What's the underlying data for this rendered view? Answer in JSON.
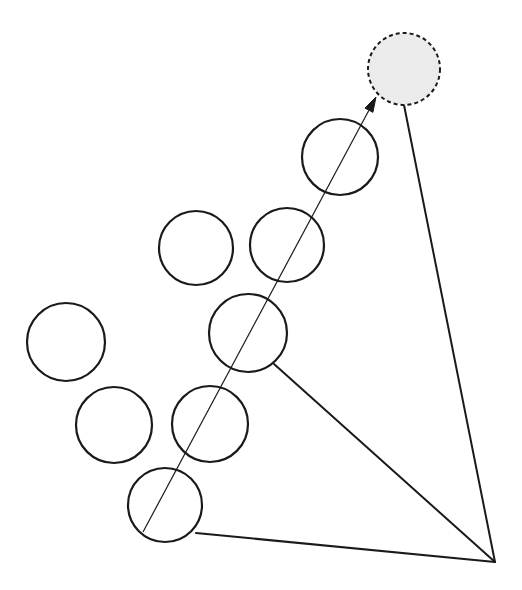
{
  "canvas": {
    "width": 522,
    "height": 590,
    "background_color": "#ffffff"
  },
  "style": {
    "circle_stroke_color": "#1a1a1a",
    "circle_stroke_width": 2.2,
    "circle_fill": "none",
    "target_fill_color": "#ebebeb",
    "target_stroke_color": "#1a1a1a",
    "target_stroke_width": 2.0,
    "target_dash_pattern": "4 3",
    "edge_stroke_color": "#1a1a1a",
    "edge_stroke_width": 2.0,
    "arrow_stroke_color": "#1a1a1a",
    "arrow_stroke_width": 1.2
  },
  "chart_data": {
    "type": "scatter",
    "title": "",
    "xlabel": "",
    "ylabel": "",
    "nodes": [
      {
        "id": "c1",
        "label": "circle-1",
        "cx": 66,
        "cy": 342,
        "r": 39,
        "filled": false,
        "dashed": false
      },
      {
        "id": "c2",
        "label": "circle-2",
        "cx": 114,
        "cy": 425,
        "r": 38,
        "filled": false,
        "dashed": false
      },
      {
        "id": "c3",
        "label": "circle-3",
        "cx": 210,
        "cy": 424,
        "r": 38,
        "filled": false,
        "dashed": false
      },
      {
        "id": "c4",
        "label": "circle-4",
        "cx": 165,
        "cy": 505,
        "r": 37,
        "filled": false,
        "dashed": false
      },
      {
        "id": "c5",
        "label": "circle-5",
        "cx": 196,
        "cy": 248,
        "r": 37,
        "filled": false,
        "dashed": false
      },
      {
        "id": "c6",
        "label": "circle-6",
        "cx": 287,
        "cy": 245,
        "r": 37,
        "filled": false,
        "dashed": false
      },
      {
        "id": "c7",
        "label": "circle-7",
        "cx": 248,
        "cy": 333,
        "r": 39,
        "filled": false,
        "dashed": false
      },
      {
        "id": "c8",
        "label": "circle-8",
        "cx": 340,
        "cy": 157,
        "r": 38,
        "filled": false,
        "dashed": false
      },
      {
        "id": "target",
        "label": "target-circle",
        "cx": 404,
        "cy": 69,
        "r": 36,
        "filled": true,
        "dashed": true
      }
    ],
    "apex": {
      "x": 495,
      "y": 562,
      "label": "apex-vertex"
    },
    "edges": [
      {
        "id": "e1",
        "label": "edge-target-to-apex",
        "x1": 404,
        "y1": 105,
        "x2": 495,
        "y2": 562
      },
      {
        "id": "e2",
        "label": "edge-circle7-to-apex",
        "x1": 274,
        "y1": 364,
        "x2": 495,
        "y2": 562
      },
      {
        "id": "e3",
        "label": "edge-circle4-to-apex",
        "x1": 196,
        "y1": 533,
        "x2": 495,
        "y2": 562
      }
    ],
    "arrow": {
      "id": "a1",
      "label": "direction-arrow",
      "x1": 143,
      "y1": 532,
      "x2": 376,
      "y2": 97,
      "head_length": 15,
      "head_width": 9,
      "head_filled": true
    },
    "counts": {
      "open_circles": 8,
      "shaded_circles": 1,
      "edges": 3,
      "arrows": 1
    }
  }
}
